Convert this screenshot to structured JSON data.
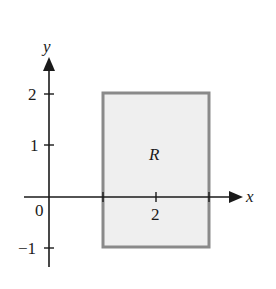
{
  "figure": {
    "axes": {
      "x_label": "x",
      "y_label": "y",
      "origin_label": "0",
      "x_ticks": [
        {
          "value": 2,
          "label": "2"
        }
      ],
      "y_ticks": [
        {
          "value": 2,
          "label": "2"
        },
        {
          "value": 1,
          "label": "1"
        },
        {
          "value": -1,
          "label": "−1"
        }
      ]
    },
    "region": {
      "label": "R",
      "x_range": [
        1,
        3
      ],
      "y_range": [
        -1,
        2
      ],
      "fill_color": "#efefef",
      "border_color": "#8a8a8a"
    },
    "axis_color": "#1a1a1a"
  }
}
